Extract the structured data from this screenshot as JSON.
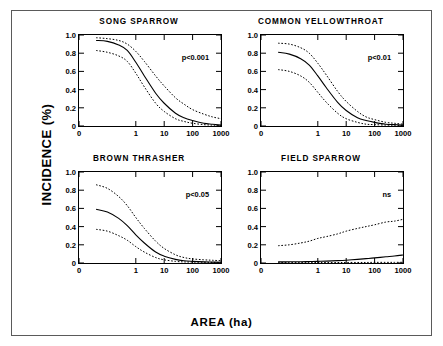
{
  "figure": {
    "xlabel": "AREA (ha)",
    "ylabel": "INCIDENCE (%)"
  },
  "chart_data": {
    "type": "line",
    "title": "",
    "xlabel": "AREA (ha)",
    "ylabel": "INCIDENCE (%)",
    "xscale": "log",
    "xlim": [
      0,
      1000
    ],
    "ylim": [
      0,
      1.0
    ],
    "xticks": [
      "0",
      "1",
      "10",
      "100",
      "1000"
    ],
    "yticks": [
      "0",
      "0.2",
      "0.4",
      "0.6",
      "0.8",
      "1.0"
    ],
    "grid": false,
    "legend": "none",
    "x_values": [
      0.04,
      0.1,
      0.25,
      0.5,
      1,
      2,
      5,
      10,
      25,
      50,
      100,
      250,
      500,
      1000
    ],
    "panels": [
      {
        "id": "song-sparrow",
        "title": "SONG SPARROW",
        "annotation": "p<0.001",
        "series": [
          {
            "name": "upper confidence band",
            "style": "dotted",
            "values": [
              0.97,
              0.96,
              0.94,
              0.9,
              0.82,
              0.71,
              0.55,
              0.44,
              0.31,
              0.24,
              0.18,
              0.13,
              0.1,
              0.08
            ]
          },
          {
            "name": "fitted incidence",
            "style": "solid",
            "values": [
              0.94,
              0.93,
              0.89,
              0.83,
              0.7,
              0.55,
              0.36,
              0.25,
              0.14,
              0.09,
              0.06,
              0.03,
              0.02,
              0.01
            ]
          },
          {
            "name": "lower confidence band",
            "style": "dotted",
            "values": [
              0.83,
              0.81,
              0.77,
              0.71,
              0.58,
              0.43,
              0.25,
              0.16,
              0.08,
              0.05,
              0.03,
              0.015,
              0.01,
              0.005
            ]
          }
        ]
      },
      {
        "id": "common-yellowthroat",
        "title": "COMMON YELLOWTHROAT",
        "annotation": "p<0.01",
        "series": [
          {
            "name": "upper confidence band",
            "style": "dotted",
            "values": [
              0.91,
              0.9,
              0.86,
              0.8,
              0.69,
              0.56,
              0.38,
              0.27,
              0.16,
              0.1,
              0.07,
              0.04,
              0.03,
              0.02
            ]
          },
          {
            "name": "fitted incidence",
            "style": "solid",
            "values": [
              0.81,
              0.79,
              0.74,
              0.67,
              0.55,
              0.42,
              0.26,
              0.17,
              0.09,
              0.06,
              0.04,
              0.02,
              0.015,
              0.01
            ]
          },
          {
            "name": "lower confidence band",
            "style": "dotted",
            "values": [
              0.62,
              0.6,
              0.55,
              0.48,
              0.37,
              0.26,
              0.14,
              0.08,
              0.04,
              0.02,
              0.015,
              0.01,
              0.008,
              0.006
            ]
          }
        ]
      },
      {
        "id": "brown-thrasher",
        "title": "BROWN THRASHER",
        "annotation": "p<0.05",
        "series": [
          {
            "name": "upper confidence band",
            "style": "dotted",
            "values": [
              0.86,
              0.82,
              0.73,
              0.63,
              0.5,
              0.38,
              0.24,
              0.16,
              0.09,
              0.06,
              0.045,
              0.035,
              0.03,
              0.025
            ]
          },
          {
            "name": "fitted incidence",
            "style": "solid",
            "values": [
              0.59,
              0.56,
              0.49,
              0.41,
              0.31,
              0.22,
              0.12,
              0.075,
              0.04,
              0.025,
              0.018,
              0.012,
              0.01,
              0.008
            ]
          },
          {
            "name": "lower confidence band",
            "style": "dotted",
            "values": [
              0.37,
              0.35,
              0.3,
              0.25,
              0.18,
              0.12,
              0.06,
              0.035,
              0.018,
              0.012,
              0.01,
              0.008,
              0.006,
              0.005
            ]
          }
        ]
      },
      {
        "id": "field-sparrow",
        "title": "FIELD SPARROW",
        "annotation": "ns",
        "series": [
          {
            "name": "upper confidence band",
            "style": "dotted",
            "values": [
              0.19,
              0.2,
              0.22,
              0.24,
              0.27,
              0.29,
              0.32,
              0.35,
              0.38,
              0.4,
              0.42,
              0.45,
              0.46,
              0.48
            ]
          },
          {
            "name": "fitted incidence",
            "style": "solid",
            "values": [
              0.012,
              0.013,
              0.014,
              0.016,
              0.018,
              0.021,
              0.026,
              0.031,
              0.04,
              0.048,
              0.056,
              0.068,
              0.077,
              0.088
            ]
          },
          {
            "name": "lower confidence band",
            "style": "dotted",
            "values": [
              0.004,
              0.004,
              0.004,
              0.004,
              0.005,
              0.005,
              0.005,
              0.006,
              0.006,
              0.006,
              0.007,
              0.007,
              0.007,
              0.008
            ]
          }
        ]
      }
    ]
  }
}
